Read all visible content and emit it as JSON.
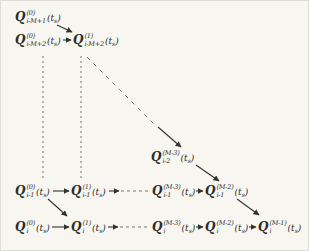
{
  "figure": {
    "background": "#f7f6f1",
    "ink": "#35322c",
    "dash_ink": "#6b675f"
  },
  "math": {
    "symbol": "Q",
    "arg": {
      "open": "(",
      "var": "t",
      "sub": "s",
      "close": ")"
    }
  },
  "nodes": [
    {
      "id": "q-i-minus-M-plus-1-ord-0",
      "sup": "(0)",
      "sub": "i-M+1",
      "x": 14,
      "y": 8
    },
    {
      "id": "q-i-minus-M-plus-2-ord-0",
      "sup": "(0)",
      "sub": "i-M+2",
      "x": 14,
      "y": 31
    },
    {
      "id": "q-i-minus-M-plus-2-ord-1",
      "sup": "(1)",
      "sub": "i-M+2",
      "x": 72,
      "y": 31
    },
    {
      "id": "q-i-minus-2-ord-M-minus-3",
      "sup": "(M-3)",
      "sub": "i-2",
      "x": 150,
      "y": 148
    },
    {
      "id": "q-i-minus-1-ord-0",
      "sup": "(0)",
      "sub": "i-1",
      "x": 14,
      "y": 182
    },
    {
      "id": "q-i-minus-1-ord-1",
      "sup": "(1)",
      "sub": "i-1",
      "x": 70,
      "y": 182
    },
    {
      "id": "q-i-minus-1-ord-M-minus-3",
      "sup": "(M-3)",
      "sub": "i-1",
      "x": 151,
      "y": 182
    },
    {
      "id": "q-i-minus-1-ord-M-minus-2",
      "sup": "(M-2)",
      "sub": "i-1",
      "x": 204,
      "y": 182
    },
    {
      "id": "q-i-ord-0",
      "sup": "(0)",
      "sub": "i",
      "x": 14,
      "y": 218
    },
    {
      "id": "q-i-ord-1",
      "sup": "(1)",
      "sub": "i",
      "x": 70,
      "y": 218
    },
    {
      "id": "q-i-ord-M-minus-3",
      "sup": "(M-3)",
      "sub": "i",
      "x": 151,
      "y": 218
    },
    {
      "id": "q-i-ord-M-minus-2",
      "sup": "(M-2)",
      "sub": "i",
      "x": 204,
      "y": 218
    },
    {
      "id": "q-i-ord-M-minus-1",
      "sup": "(M-1)",
      "sub": "i",
      "x": 257,
      "y": 218
    }
  ],
  "edges": [
    {
      "x1": 56,
      "y1": 24,
      "x2": 71,
      "y2": 31,
      "style": "solid",
      "arrow": true
    },
    {
      "x1": 62,
      "y1": 39,
      "x2": 70,
      "y2": 39,
      "style": "solid",
      "arrow": true
    },
    {
      "x1": 42,
      "y1": 55,
      "x2": 42,
      "y2": 179,
      "style": "dash-v",
      "arrow": false
    },
    {
      "x1": 80,
      "y1": 55,
      "x2": 80,
      "y2": 179,
      "style": "dash-v",
      "arrow": false
    },
    {
      "x1": 86,
      "y1": 56,
      "x2": 153,
      "y2": 123,
      "style": "dash-d",
      "arrow": false
    },
    {
      "x1": 157,
      "y1": 126,
      "x2": 180,
      "y2": 146,
      "style": "solid",
      "arrow": true
    },
    {
      "x1": 195,
      "y1": 164,
      "x2": 218,
      "y2": 180,
      "style": "solid",
      "arrow": true
    },
    {
      "x1": 52,
      "y1": 190,
      "x2": 68,
      "y2": 190,
      "style": "solid",
      "arrow": true
    },
    {
      "x1": 108,
      "y1": 190,
      "x2": 118,
      "y2": 190,
      "style": "solid",
      "arrow": true
    },
    {
      "x1": 120,
      "y1": 190,
      "x2": 149,
      "y2": 190,
      "style": "dash-h",
      "arrow": false
    },
    {
      "x1": 195,
      "y1": 190,
      "x2": 202,
      "y2": 190,
      "style": "solid",
      "arrow": true
    },
    {
      "x1": 47,
      "y1": 198,
      "x2": 66,
      "y2": 215,
      "style": "solid",
      "arrow": true
    },
    {
      "x1": 236,
      "y1": 198,
      "x2": 258,
      "y2": 214,
      "style": "solid",
      "arrow": true
    },
    {
      "x1": 51,
      "y1": 226,
      "x2": 68,
      "y2": 226,
      "style": "solid",
      "arrow": true
    },
    {
      "x1": 107,
      "y1": 226,
      "x2": 117,
      "y2": 226,
      "style": "solid",
      "arrow": true
    },
    {
      "x1": 119,
      "y1": 226,
      "x2": 149,
      "y2": 226,
      "style": "dash-h",
      "arrow": false
    },
    {
      "x1": 195,
      "y1": 226,
      "x2": 202,
      "y2": 226,
      "style": "solid",
      "arrow": true
    },
    {
      "x1": 248,
      "y1": 226,
      "x2": 255,
      "y2": 226,
      "style": "solid",
      "arrow": true
    }
  ]
}
